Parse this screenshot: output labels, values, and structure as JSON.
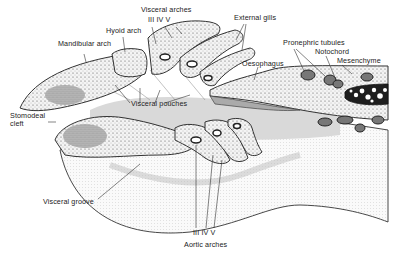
{
  "diagram": {
    "colors": {
      "ink": "#2a2a2a",
      "tissue_fill": "#f1f1f1",
      "shade": "#d4d4d4",
      "notochord_fill": "#1e1e1e",
      "background": "#ffffff"
    },
    "labels": {
      "visceral_arches": "Visceral arches",
      "visceral_arches_numerals": "III  IV  V",
      "hyoid_arch": "Hyoid arch",
      "mandibular_arch": "Mandibular arch",
      "external_gills": "External gills",
      "oesophagus": "Oesophagus",
      "pronephric_tubules": "Pronephric tubules",
      "notochord": "Notochord",
      "mesenchyme": "Mesenchyme",
      "stomodeal_cleft_line1": "Stomodeal",
      "stomodeal_cleft_line2": "cleft",
      "visceral_pouches": "Visceral pouches",
      "visceral_groove": "Visceral groove",
      "aortic_arches_numerals": "III  IV  V",
      "aortic_arches": "Aortic arches"
    }
  }
}
